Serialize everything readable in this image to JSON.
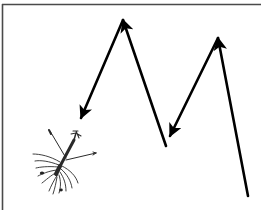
{
  "figure": {
    "type": "diagram",
    "colors": {
      "background": "#ffffff",
      "frame": "#4a4a4a",
      "arrows": "#000000",
      "organism": "#2a2a2a"
    },
    "frame": {
      "top_y": 4.5,
      "left_x": 2.5,
      "sides": [
        "top",
        "left"
      ]
    },
    "arrows": [
      {
        "id": "descent-1",
        "from": [
          123,
          20
        ],
        "to": [
          81,
          118
        ],
        "head": "end"
      },
      {
        "id": "ascent-1",
        "from": [
          166,
          146
        ],
        "to": [
          123,
          20
        ],
        "head": "end"
      },
      {
        "id": "descent-2",
        "from": [
          218,
          38
        ],
        "to": [
          170,
          136
        ],
        "head": "end"
      },
      {
        "id": "ascent-2",
        "from": [
          248,
          196
        ],
        "to": [
          218,
          38
        ],
        "head": "end"
      }
    ],
    "organism": {
      "label": "larva-illustration",
      "center": [
        62,
        165
      ]
    }
  }
}
